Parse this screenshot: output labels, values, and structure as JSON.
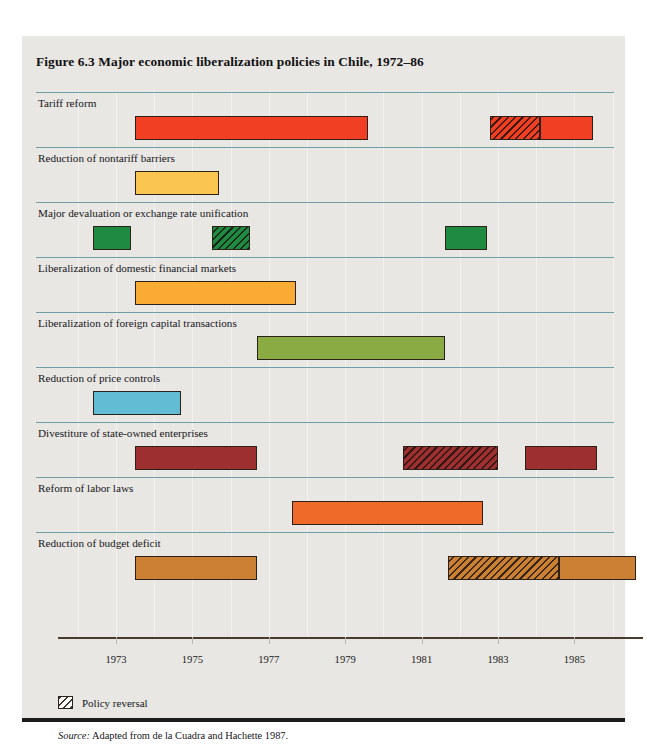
{
  "figure": {
    "title": "Figure 6.3  Major economic liberalization policies in Chile, 1972–86",
    "source_word": "Source:",
    "source_text": " Adapted from de la Cuadra and Hachette 1987."
  },
  "legend": {
    "reversal_label": "Policy reversal",
    "reversal_swatch": "diagonal-hatch"
  },
  "chart_data": {
    "type": "bar",
    "title": "Figure 6.3  Major economic liberalization policies in Chile, 1972–86",
    "subtitle": "",
    "xlabel": "",
    "ylabel": "",
    "orientation": "horizontal-timeline",
    "xlim": [
      1972.0,
      1986.8
    ],
    "grid": true,
    "grid_axis": "x",
    "legend_position": "below-axis-left",
    "tick_labels": [
      "1973",
      "1975",
      "1977",
      "1979",
      "1981",
      "1983",
      "1985"
    ],
    "tick_values": [
      1973,
      1975,
      1977,
      1979,
      1981,
      1983,
      1985
    ],
    "categories": [
      "Tariff reform",
      "Reduction of nontariff barriers",
      "Major devaluation or exchange rate unification",
      "Liberalization of domestic financial markets",
      "Liberalization of foreign capital transactions",
      "Reduction of price controls",
      "Divestiture of state-owned enterprises",
      "Reform of labor laws",
      "Reduction of budget deficit"
    ],
    "series": [
      {
        "name": "Tariff reform",
        "color": "#f03f22",
        "segments": [
          {
            "start": 1973.5,
            "end": 1979.6,
            "reversal": false
          },
          {
            "start": 1982.8,
            "end": 1984.1,
            "reversal": true
          },
          {
            "start": 1984.1,
            "end": 1985.5,
            "reversal": false
          }
        ]
      },
      {
        "name": "Reduction of nontariff barriers",
        "color": "#fbc552",
        "segments": [
          {
            "start": 1973.5,
            "end": 1975.7,
            "reversal": false
          }
        ]
      },
      {
        "name": "Major devaluation or exchange rate unification",
        "color": "#1f8a41",
        "segments": [
          {
            "start": 1972.4,
            "end": 1973.4,
            "reversal": false
          },
          {
            "start": 1975.5,
            "end": 1976.5,
            "reversal": true
          },
          {
            "start": 1981.6,
            "end": 1982.7,
            "reversal": false
          }
        ]
      },
      {
        "name": "Liberalization of domestic financial markets",
        "color": "#f9ab34",
        "segments": [
          {
            "start": 1973.5,
            "end": 1977.7,
            "reversal": false
          }
        ]
      },
      {
        "name": "Liberalization of foreign capital transactions",
        "color": "#8aab44",
        "segments": [
          {
            "start": 1976.7,
            "end": 1981.6,
            "reversal": false
          }
        ]
      },
      {
        "name": "Reduction of price controls",
        "color": "#62bcd4",
        "segments": [
          {
            "start": 1972.4,
            "end": 1974.7,
            "reversal": false
          }
        ]
      },
      {
        "name": "Divestiture of state-owned enterprises",
        "color": "#9e2f30",
        "segments": [
          {
            "start": 1973.5,
            "end": 1976.7,
            "reversal": false
          },
          {
            "start": 1980.5,
            "end": 1983.0,
            "reversal": true
          },
          {
            "start": 1983.7,
            "end": 1985.6,
            "reversal": false
          }
        ]
      },
      {
        "name": "Reform of labor laws",
        "color": "#ef6a28",
        "segments": [
          {
            "start": 1977.6,
            "end": 1982.6,
            "reversal": false
          }
        ]
      },
      {
        "name": "Reduction of budget deficit",
        "color": "#cc8034",
        "segments": [
          {
            "start": 1973.5,
            "end": 1976.7,
            "reversal": false
          },
          {
            "start": 1981.7,
            "end": 1984.6,
            "reversal": true
          },
          {
            "start": 1984.6,
            "end": 1986.6,
            "reversal": false
          }
        ]
      }
    ]
  }
}
